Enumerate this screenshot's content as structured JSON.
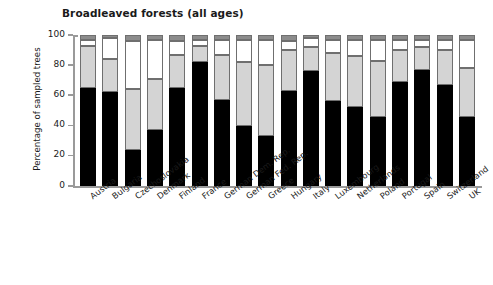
{
  "chart_data": {
    "type": "bar",
    "subtype": "stacked-bar",
    "title": "Broadleaved forests (all ages)",
    "xlabel": "",
    "ylabel": "Percentage of sampled trees",
    "ylim": [
      0,
      100
    ],
    "yticks": [
      0,
      20,
      40,
      60,
      80,
      100
    ],
    "ytick_labels": [
      "0",
      "20",
      "40",
      "60",
      "80",
      "100"
    ],
    "grid": false,
    "legend": "none",
    "stack_order": "bottom-to-top",
    "categories": [
      "Austria",
      "Bulgaria",
      "Czechoslovakia",
      "Denmark",
      "Finland",
      "France",
      "German Dem. Rep.",
      "German Fed. Rep.",
      "Greece",
      "Hungary",
      "Italy",
      "Luxembourg",
      "Netherlands",
      "Poland",
      "Portugal",
      "Spain",
      "Switzerland",
      "UK"
    ],
    "series": [
      {
        "name": "black-segment",
        "color": "#000000",
        "values": [
          65,
          62,
          24,
          37,
          65,
          82,
          57,
          40,
          33,
          63,
          76,
          56,
          52,
          46,
          69,
          77,
          67,
          46
        ]
      },
      {
        "name": "light-gray-segment",
        "color": "#d4d4d4",
        "values": [
          28,
          22,
          40,
          34,
          22,
          11,
          30,
          42,
          47,
          27,
          16,
          32,
          34,
          37,
          21,
          15,
          23,
          32
        ]
      },
      {
        "name": "white-segment",
        "color": "#ffffff",
        "values": [
          4,
          14,
          32,
          26,
          9,
          4,
          10,
          15,
          17,
          6,
          6,
          9,
          11,
          14,
          7,
          5,
          7,
          19
        ]
      },
      {
        "name": "dark-gray-segment",
        "color": "#8c8c8c",
        "values": [
          3,
          2,
          4,
          3,
          4,
          3,
          3,
          3,
          3,
          4,
          2,
          3,
          3,
          3,
          3,
          3,
          3,
          3
        ]
      }
    ],
    "cumulative_tops": {
      "Austria": [
        65,
        93,
        97,
        100
      ],
      "Bulgaria": [
        62,
        84,
        98,
        100
      ],
      "Czechoslovakia": [
        24,
        64,
        96,
        100
      ],
      "Denmark": [
        37,
        71,
        97,
        100
      ],
      "Finland": [
        65,
        87,
        96,
        100
      ],
      "France": [
        82,
        93,
        97,
        100
      ],
      "German Dem. Rep.": [
        57,
        87,
        97,
        100
      ],
      "German Fed. Rep.": [
        40,
        82,
        97,
        100
      ],
      "Greece": [
        33,
        80,
        97,
        100
      ],
      "Hungary": [
        63,
        90,
        96,
        100
      ],
      "Italy": [
        76,
        92,
        98,
        100
      ],
      "Luxembourg": [
        56,
        88,
        97,
        100
      ],
      "Netherlands": [
        52,
        86,
        97,
        100
      ],
      "Poland": [
        46,
        83,
        97,
        100
      ],
      "Portugal": [
        69,
        90,
        97,
        100
      ],
      "Spain": [
        77,
        92,
        97,
        100
      ],
      "Switzerland": [
        67,
        90,
        97,
        100
      ],
      "UK": [
        46,
        78,
        97,
        100
      ]
    }
  },
  "colors": {
    "axis": "#9a9a9a",
    "text": "#1a1a1a",
    "background": "#ffffff",
    "segment_border": "#6f6f6f"
  }
}
